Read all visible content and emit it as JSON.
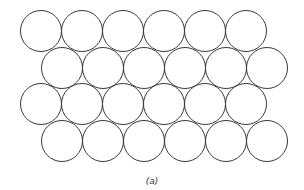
{
  "figure": {
    "caption": "(a)",
    "stroke_color": "#3a3a3a",
    "fill_color": "#ffffff",
    "radius": 20.5,
    "rows": [
      {
        "cy": 31,
        "cx": [
          41,
          82,
          123,
          164,
          205,
          246
        ]
      },
      {
        "cy": 68,
        "cx": [
          62,
          103,
          144,
          185,
          226,
          267
        ]
      },
      {
        "cy": 104,
        "cx": [
          41,
          82,
          123,
          164,
          205,
          246
        ]
      },
      {
        "cy": 141,
        "cx": [
          62,
          103,
          144,
          185,
          226,
          267
        ]
      }
    ]
  }
}
